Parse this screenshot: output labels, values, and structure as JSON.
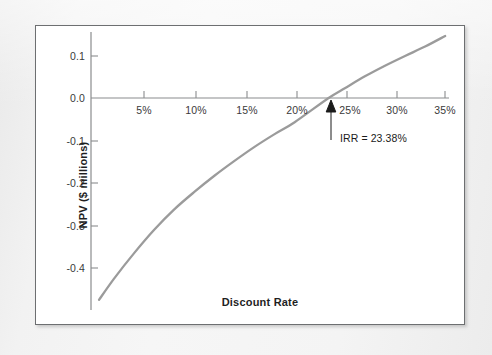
{
  "figure": {
    "frame_color": "#6d6f71",
    "background_color": "#ffffff",
    "page_background": "#f2f2f2"
  },
  "chart_data": {
    "type": "line",
    "title": "",
    "xlabel": "Discount Rate",
    "ylabel": "NPV ($ millions)",
    "xtick_labels": [
      "5%",
      "10%",
      "15%",
      "20%",
      "25%",
      "30%",
      "35%"
    ],
    "xticks": [
      5,
      10,
      15,
      20,
      25,
      30,
      35
    ],
    "ytick_labels": [
      "0.1",
      "0.0",
      "-0.1",
      "-0.2",
      "-0.3",
      "-0.4"
    ],
    "yticks": [
      0.1,
      0.0,
      -0.1,
      -0.2,
      -0.3,
      -0.4
    ],
    "xlim": [
      0,
      35
    ],
    "ylim": [
      -0.48,
      0.15
    ],
    "grid": false,
    "legend": false,
    "legend_position": "none",
    "series": [
      {
        "name": "NPV profile",
        "color": "#9b9b9b",
        "x": [
          0.5,
          2,
          4,
          6,
          8,
          10,
          12,
          14,
          16,
          18,
          20,
          23.38,
          25,
          27,
          29,
          31,
          33,
          35
        ],
        "y": [
          -0.475,
          -0.425,
          -0.365,
          -0.31,
          -0.262,
          -0.221,
          -0.183,
          -0.148,
          -0.115,
          -0.085,
          -0.057,
          0.0,
          0.023,
          0.051,
          0.076,
          0.099,
          0.121,
          0.146
        ]
      }
    ],
    "annotations": [
      {
        "name": "irr-callout",
        "text": "IRR = 23.38%",
        "x": 23.38,
        "y": 0.0,
        "arrow": "up"
      }
    ]
  }
}
